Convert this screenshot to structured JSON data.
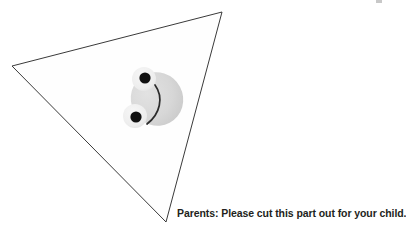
{
  "page": {
    "background_color": "#ffffff",
    "width": 400,
    "height": 236
  },
  "instruction": {
    "text": "Parents: Please cut this part out for your child.",
    "color": "#231f20",
    "bold": true
  },
  "cut_shape": {
    "name": "triangle",
    "label": "cut-out triangle",
    "stroke_color": "#3a3a3a",
    "fill_color": "#fefefe",
    "stroke_width": 1,
    "vertices": [
      {
        "x": 222,
        "y": 12
      },
      {
        "x": 12,
        "y": 66
      },
      {
        "x": 166,
        "y": 222
      }
    ]
  },
  "character": {
    "name": "frog-face",
    "head_color": "#d6d6d6",
    "bump_color": "#efefef",
    "pupil_color": "#111111",
    "mouth_color": "#2b2b2b",
    "head": {
      "cx": 157,
      "cy": 99,
      "rx": 26,
      "ry": 27,
      "rotation": -28
    },
    "eyes": [
      {
        "name": "upper-eye",
        "bump_cx": 144,
        "bump_cy": 79,
        "bump_r": 12,
        "pupil_cx": 145,
        "pupil_cy": 78,
        "pupil_r": 5.6
      },
      {
        "name": "lower-eye",
        "bump_cx": 135,
        "bump_cy": 116,
        "bump_r": 12,
        "pupil_cx": 136,
        "pupil_cy": 117,
        "pupil_r": 5.6
      }
    ],
    "mouth": {
      "start_x": 155,
      "start_y": 85,
      "end_x": 147,
      "end_y": 124,
      "bulge": 9
    }
  },
  "corner_mark": {
    "name": "page-edge-mark",
    "color": "#9a9a9a"
  }
}
